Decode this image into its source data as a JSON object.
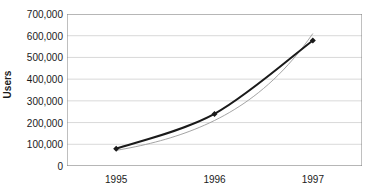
{
  "chart_data": {
    "type": "line",
    "title": "",
    "xlabel": "",
    "ylabel": "Users",
    "categories": [
      "1995",
      "1996",
      "1997"
    ],
    "series": [
      {
        "name": "Users",
        "style": "line-with-diamond-markers",
        "color": "#1a1a1a",
        "values": [
          80000,
          240000,
          578000
        ]
      },
      {
        "name": "Trendline",
        "style": "thin-smooth-line",
        "color": "#9a9a9a",
        "values": [
          72000,
          250000,
          610000
        ]
      }
    ],
    "ylim": [
      0,
      700000
    ],
    "ytick_step": 100000,
    "ytick_labels": [
      "0",
      "100,000",
      "200,000",
      "300,000",
      "400,000",
      "500,000",
      "600,000",
      "700,000"
    ],
    "ytick_values": [
      0,
      100000,
      200000,
      300000,
      400000,
      500000,
      600000,
      700000
    ],
    "xtick_labels": [
      "1995",
      "1996",
      "1997"
    ],
    "grid": "horizontal",
    "grid_color": "#d9d9d9",
    "axis_color": "#808080",
    "plot_background": "#ffffff",
    "legend": "none"
  }
}
